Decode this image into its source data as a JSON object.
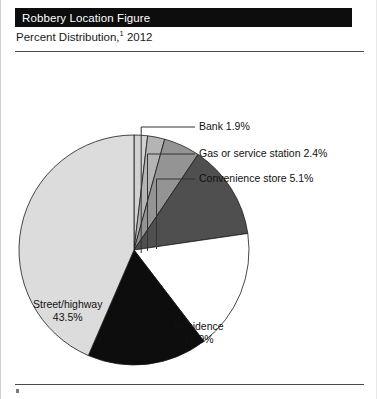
{
  "header": {
    "title": "Robbery Location Figure",
    "subtitle_prefix": "Percent Distribution,",
    "subtitle_footnote": "1",
    "subtitle_year": " 2012"
  },
  "chart_data": {
    "type": "pie",
    "title": "Robbery Location Figure",
    "subtitle": "Percent Distribution, 2012",
    "unit": "percent",
    "legend": "none",
    "label_placement": "inside-and-callout",
    "start_angle_deg": 0,
    "direction": "clockwise",
    "categories": [
      "Bank",
      "Gas or service station",
      "Convenience store",
      "Commercial house",
      "Residence",
      "Miscellaneous",
      "Street/highway"
    ],
    "values": [
      1.9,
      2.4,
      5.1,
      13.3,
      16.9,
      16.9,
      43.5
    ],
    "colors": [
      "#d2d2d2",
      "#b4b4b4",
      "#949494",
      "#4f4f4f",
      "#ffffff",
      "#0d0d0d",
      "#dcdcdc"
    ],
    "slices": [
      {
        "name": "Bank",
        "value": 1.9,
        "label": "Bank 1.9%",
        "value_label": "1.9%",
        "color": "#d2d2d2",
        "label_style": "callout"
      },
      {
        "name": "Gas or service station",
        "value": 2.4,
        "label": "Gas or service station 2.4%",
        "value_label": "2.4%",
        "color": "#b4b4b4",
        "label_style": "callout"
      },
      {
        "name": "Convenience store",
        "value": 5.1,
        "label": "Convenience store 5.1%",
        "value_label": "5.1%",
        "color": "#949494",
        "label_style": "callout"
      },
      {
        "name": "Commercial house",
        "value": 13.3,
        "label": "Commercial",
        "label_line2": "house 13.3%",
        "value_label": "13.3%",
        "color": "#4f4f4f",
        "label_style": "inside"
      },
      {
        "name": "Residence",
        "value": 16.9,
        "label": "Residence",
        "value_label": "16.9%",
        "color": "#ffffff",
        "label_style": "inside"
      },
      {
        "name": "Miscellaneous",
        "value": 16.9,
        "label": "Miscellaneous",
        "value_label": "16.9%",
        "color": "#0d0d0d",
        "label_style": "inside"
      },
      {
        "name": "Street/highway",
        "value": 43.5,
        "label": "Street/highway",
        "value_label": "43.5%",
        "color": "#dcdcdc",
        "label_style": "inside"
      }
    ]
  }
}
